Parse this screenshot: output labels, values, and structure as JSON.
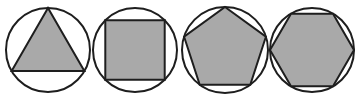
{
  "diagram": {
    "fill_color": "#a9a9a9",
    "stroke_color": "#1e1e1e",
    "figures": [
      {
        "shape": "triangle",
        "sides": 3,
        "cx": 48,
        "cy": 50,
        "r": 42,
        "rotation_deg": -90
      },
      {
        "shape": "square",
        "sides": 4,
        "cx": 135,
        "cy": 50,
        "r": 42,
        "rotation_deg": -45
      },
      {
        "shape": "pentagon",
        "sides": 5,
        "cx": 225,
        "cy": 50,
        "r": 43,
        "rotation_deg": -90
      },
      {
        "shape": "hexagon",
        "sides": 6,
        "cx": 312,
        "cy": 50,
        "r": 42,
        "rotation_deg": 0
      }
    ]
  }
}
